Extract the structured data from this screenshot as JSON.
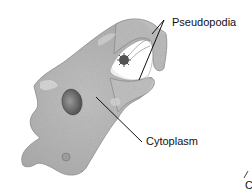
{
  "diagram": {
    "labels": {
      "pseudopodia": "Pseudopodia",
      "cytoplasm": "Cytoplasm",
      "partial_bottom_right": "C"
    },
    "colors": {
      "cell_body": "#b9b9b9",
      "cell_body_light": "#d6d6d6",
      "nucleus": "#6e6e6e",
      "food_particle": "#555555",
      "leader_line": "#111111",
      "background": "#ffffff"
    }
  }
}
